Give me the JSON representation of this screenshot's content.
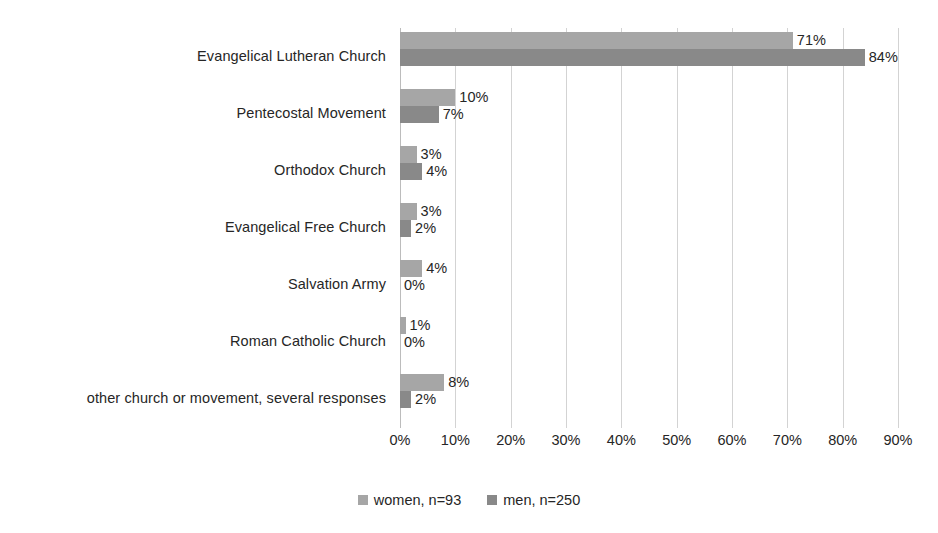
{
  "chart_data": {
    "type": "bar",
    "orientation": "horizontal",
    "title": "",
    "subtitle": "",
    "xlabel": "",
    "ylabel": "",
    "xlim": [
      0,
      90
    ],
    "xtick_step": 10,
    "grid": true,
    "legend_position": "bottom-center",
    "categories": [
      "Evangelical Lutheran Church",
      "Pentecostal Movement",
      "Orthodox Church",
      "Evangelical Free Church",
      "Salvation Army",
      "Roman Catholic Church",
      "other church or movement, several responses"
    ],
    "tick_labels": [
      "0%",
      "10%",
      "20%",
      "30%",
      "40%",
      "50%",
      "60%",
      "70%",
      "80%",
      "90%"
    ],
    "tick_values": [
      0,
      10,
      20,
      30,
      40,
      50,
      60,
      70,
      80,
      90
    ],
    "series": [
      {
        "name": "women, n=93",
        "key": "women",
        "color": "#a6a6a6",
        "values": [
          71,
          10,
          3,
          3,
          4,
          1,
          8
        ],
        "data_labels": [
          "71%",
          "10%",
          "3%",
          "3%",
          "4%",
          "1%",
          "8%"
        ]
      },
      {
        "name": "men, n=250",
        "key": "men",
        "color": "#898989",
        "values": [
          84,
          7,
          4,
          2,
          0,
          0,
          2
        ],
        "data_labels": [
          "84%",
          "7%",
          "4%",
          "2%",
          "0%",
          "0%",
          "2%"
        ]
      }
    ]
  },
  "legend": {
    "items": [
      {
        "label": "women, n=93",
        "color": "#a6a6a6"
      },
      {
        "label": "men, n=250",
        "color": "#898989"
      }
    ]
  },
  "colors": {
    "series_women": "#a6a6a6",
    "series_men": "#898989",
    "gridline": "#d3d3d3",
    "text": "#262626",
    "background": "#ffffff"
  }
}
